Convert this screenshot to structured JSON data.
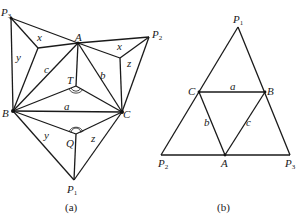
{
  "figure_a": {
    "caption": "(a)",
    "points": {
      "P3": {
        "label": "P",
        "sub": "3"
      },
      "P2": {
        "label": "P",
        "sub": "2"
      },
      "P1": {
        "label": "P",
        "sub": "1"
      },
      "A": {
        "label": "A"
      },
      "B": {
        "label": "B"
      },
      "C": {
        "label": "C"
      },
      "T": {
        "label": "T"
      },
      "Q": {
        "label": "Q"
      }
    },
    "edge_labels": {
      "x_left": "x",
      "x_right": "x",
      "y_left": "y",
      "y_bottom": "y",
      "z_right": "z",
      "z_bottom": "z",
      "a": "a",
      "b": "b",
      "c": "c"
    }
  },
  "figure_b": {
    "caption": "(b)",
    "points": {
      "P1": {
        "label": "P",
        "sub": "1"
      },
      "P2": {
        "label": "P",
        "sub": "2"
      },
      "P3": {
        "label": "P",
        "sub": "3"
      },
      "A": {
        "label": "A"
      },
      "B": {
        "label": "B"
      },
      "C": {
        "label": "C"
      }
    },
    "edge_labels": {
      "a": "a",
      "b": "b",
      "c": "c"
    }
  }
}
